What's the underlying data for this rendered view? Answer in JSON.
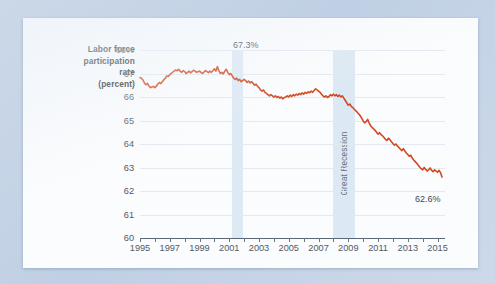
{
  "card": {
    "background": "#fbfcfd",
    "page_background": "#c5d4e6"
  },
  "axis_title": {
    "line1": "Labor force",
    "line2": "participation",
    "line3": "rate",
    "line4": "(percent)"
  },
  "annotations": [
    {
      "name": "peak-value",
      "text": "67.3%"
    },
    {
      "name": "latest-value",
      "text": "62.6%"
    },
    {
      "name": "recession-band",
      "text": "Great Recession"
    }
  ],
  "chart_data": {
    "type": "line",
    "title": "",
    "xlabel": "",
    "ylabel": "Labor force participation rate (percent)",
    "grid": true,
    "legend": "none",
    "line_color": "#d2481f",
    "band_color": "#d7e5f2",
    "xlim": [
      1995,
      2015.5
    ],
    "ylim": [
      60,
      68
    ],
    "ytick_labels": [
      "68%",
      "67",
      "66",
      "65",
      "64",
      "63",
      "62",
      "61",
      "60"
    ],
    "ytick_values": [
      68,
      67,
      66,
      65,
      64,
      63,
      62,
      61,
      60
    ],
    "xtick_labels": [
      "1995",
      "1997",
      "1999",
      "2001",
      "2003",
      "2005",
      "2007",
      "2009",
      "2011",
      "2013",
      "2015"
    ],
    "xtick_values": [
      1995,
      1997,
      1999,
      2001,
      2003,
      2005,
      2007,
      2009,
      2011,
      2013,
      2015
    ],
    "minor_xticks": [
      1995,
      1996,
      1997,
      1998,
      1999,
      2000,
      2001,
      2002,
      2003,
      2004,
      2005,
      2006,
      2007,
      2008,
      2009,
      2010,
      2011,
      2012,
      2013,
      2014,
      2015
    ],
    "shaded_bands": [
      {
        "label": "",
        "start": 2001.2,
        "end": 2001.9
      },
      {
        "label": "Great Recession",
        "start": 2007.95,
        "end": 2009.45
      }
    ],
    "annotated_points": [
      {
        "label": "67.3%",
        "x": 2000.2,
        "y": 67.3
      },
      {
        "label": "62.6%",
        "x": 2015.3,
        "y": 62.6
      }
    ],
    "series": [
      {
        "name": "Labor force participation rate",
        "x": [
          1995.0,
          1995.1,
          1995.2,
          1995.3,
          1995.4,
          1995.5,
          1995.6,
          1995.7,
          1995.8,
          1995.9,
          1996.0,
          1996.1,
          1996.2,
          1996.3,
          1996.4,
          1996.5,
          1996.6,
          1996.7,
          1996.8,
          1996.9,
          1997.0,
          1997.1,
          1997.2,
          1997.3,
          1997.4,
          1997.5,
          1997.6,
          1997.7,
          1997.8,
          1997.9,
          1998.0,
          1998.1,
          1998.2,
          1998.3,
          1998.4,
          1998.5,
          1998.6,
          1998.7,
          1998.8,
          1998.9,
          1999.0,
          1999.1,
          1999.2,
          1999.3,
          1999.4,
          1999.5,
          1999.6,
          1999.7,
          1999.8,
          1999.9,
          2000.0,
          2000.1,
          2000.2,
          2000.3,
          2000.4,
          2000.5,
          2000.6,
          2000.7,
          2000.8,
          2000.9,
          2001.0,
          2001.1,
          2001.2,
          2001.3,
          2001.4,
          2001.5,
          2001.6,
          2001.7,
          2001.8,
          2001.9,
          2002.0,
          2002.1,
          2002.2,
          2002.3,
          2002.4,
          2002.5,
          2002.6,
          2002.7,
          2002.8,
          2002.9,
          2003.0,
          2003.1,
          2003.2,
          2003.3,
          2003.4,
          2003.5,
          2003.6,
          2003.7,
          2003.8,
          2003.9,
          2004.0,
          2004.1,
          2004.2,
          2004.3,
          2004.4,
          2004.5,
          2004.6,
          2004.7,
          2004.8,
          2004.9,
          2005.0,
          2005.1,
          2005.2,
          2005.3,
          2005.4,
          2005.5,
          2005.6,
          2005.7,
          2005.8,
          2005.9,
          2006.0,
          2006.1,
          2006.2,
          2006.3,
          2006.4,
          2006.5,
          2006.6,
          2006.7,
          2006.8,
          2006.9,
          2007.0,
          2007.1,
          2007.2,
          2007.3,
          2007.4,
          2007.5,
          2007.6,
          2007.7,
          2007.8,
          2007.9,
          2008.0,
          2008.1,
          2008.2,
          2008.3,
          2008.4,
          2008.5,
          2008.6,
          2008.7,
          2008.8,
          2008.9,
          2009.0,
          2009.1,
          2009.2,
          2009.3,
          2009.4,
          2009.5,
          2009.6,
          2009.7,
          2009.8,
          2009.9,
          2010.0,
          2010.1,
          2010.2,
          2010.3,
          2010.4,
          2010.5,
          2010.6,
          2010.7,
          2010.8,
          2010.9,
          2011.0,
          2011.1,
          2011.2,
          2011.3,
          2011.4,
          2011.5,
          2011.6,
          2011.7,
          2011.8,
          2011.9,
          2012.0,
          2012.1,
          2012.2,
          2012.3,
          2012.4,
          2012.5,
          2012.6,
          2012.7,
          2012.8,
          2012.9,
          2013.0,
          2013.1,
          2013.2,
          2013.3,
          2013.4,
          2013.5,
          2013.6,
          2013.7,
          2013.8,
          2013.9,
          2014.0,
          2014.1,
          2014.2,
          2014.3,
          2014.4,
          2014.5,
          2014.6,
          2014.7,
          2014.8,
          2014.9,
          2015.0,
          2015.1,
          2015.2,
          2015.3
        ],
        "y": [
          66.83,
          66.8,
          66.72,
          66.6,
          66.52,
          66.58,
          66.47,
          66.4,
          66.42,
          66.45,
          66.4,
          66.46,
          66.55,
          66.62,
          66.57,
          66.65,
          66.73,
          66.8,
          66.9,
          66.87,
          66.95,
          67.0,
          67.06,
          67.1,
          67.15,
          67.12,
          67.18,
          67.1,
          67.05,
          67.12,
          67.08,
          67.0,
          67.05,
          67.1,
          67.03,
          67.08,
          67.14,
          67.1,
          67.05,
          67.08,
          67.1,
          67.05,
          67.0,
          67.06,
          67.12,
          67.08,
          67.04,
          67.1,
          67.05,
          67.12,
          67.2,
          67.1,
          67.3,
          67.12,
          67.0,
          67.05,
          66.98,
          67.1,
          67.18,
          67.05,
          66.95,
          67.0,
          66.9,
          66.8,
          66.75,
          66.8,
          66.7,
          66.75,
          66.65,
          66.7,
          66.75,
          66.7,
          66.62,
          66.68,
          66.6,
          66.65,
          66.58,
          66.5,
          66.55,
          66.45,
          66.4,
          66.3,
          66.25,
          66.3,
          66.2,
          66.15,
          66.1,
          66.05,
          66.1,
          66.05,
          66.0,
          66.05,
          65.98,
          66.02,
          65.95,
          66.0,
          65.92,
          65.98,
          66.0,
          66.05,
          66.0,
          66.08,
          66.02,
          66.1,
          66.05,
          66.12,
          66.08,
          66.15,
          66.1,
          66.18,
          66.12,
          66.2,
          66.15,
          66.22,
          66.18,
          66.25,
          66.2,
          66.28,
          66.35,
          66.3,
          66.25,
          66.2,
          66.12,
          66.05,
          66.0,
          66.05,
          65.98,
          66.02,
          66.1,
          66.05,
          66.12,
          66.05,
          66.1,
          66.02,
          66.08,
          66.0,
          66.05,
          65.95,
          65.85,
          65.75,
          65.65,
          65.7,
          65.6,
          65.55,
          65.48,
          65.42,
          65.35,
          65.28,
          65.2,
          65.1,
          64.98,
          64.9,
          64.95,
          65.05,
          64.9,
          64.78,
          64.7,
          64.65,
          64.58,
          64.5,
          64.42,
          64.48,
          64.4,
          64.35,
          64.28,
          64.2,
          64.15,
          64.25,
          64.18,
          64.1,
          64.02,
          63.95,
          64.0,
          63.92,
          63.85,
          63.78,
          63.72,
          63.8,
          63.7,
          63.62,
          63.55,
          63.48,
          63.52,
          63.4,
          63.32,
          63.25,
          63.18,
          63.1,
          63.02,
          62.95,
          62.9,
          63.0,
          62.92,
          62.85,
          62.9,
          62.98,
          62.88,
          62.82,
          62.9,
          62.85,
          62.8,
          62.88,
          62.78,
          62.6
        ]
      }
    ]
  }
}
